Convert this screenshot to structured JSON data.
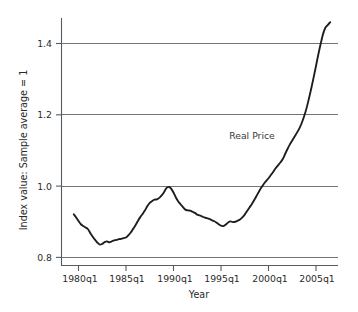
{
  "chart_data": {
    "type": "line",
    "title": "",
    "xlabel": "Year",
    "ylabel": "Index value: Sample average = 1",
    "grid": "horizontal gridlines at each y tick",
    "legend_position": "inline annotation on plot",
    "annotations": [
      {
        "text": "Real Price",
        "x": "2000q1",
        "y": 1.13
      }
    ],
    "xlim": [
      "1979q3",
      "2006q4"
    ],
    "ylim": [
      0.78,
      1.47
    ],
    "ytick_labels": [
      "0.8",
      "1.0",
      "1.2",
      "1.4"
    ],
    "ytick_values": [
      0.8,
      1.0,
      1.2,
      1.4
    ],
    "xtick_labels": [
      "1980q1",
      "1985q1",
      "1990q1",
      "1995q1",
      "2000q1",
      "2005q1"
    ],
    "xtick_values": [
      "1980q1",
      "1985q1",
      "1990q1",
      "1995q1",
      "2000q1",
      "2005q1"
    ],
    "series": [
      {
        "name": "Real Price",
        "color": "#1c1c1c",
        "x": [
          "1979q3",
          "1979q4",
          "1980q1",
          "1980q2",
          "1980q3",
          "1980q4",
          "1981q1",
          "1981q2",
          "1981q3",
          "1981q4",
          "1982q1",
          "1982q2",
          "1982q3",
          "1982q4",
          "1983q1",
          "1983q2",
          "1983q3",
          "1983q4",
          "1984q1",
          "1984q2",
          "1984q3",
          "1984q4",
          "1985q1",
          "1985q2",
          "1985q3",
          "1985q4",
          "1986q1",
          "1986q2",
          "1986q3",
          "1986q4",
          "1987q1",
          "1987q2",
          "1987q3",
          "1987q4",
          "1988q1",
          "1988q2",
          "1988q3",
          "1988q4",
          "1989q1",
          "1989q2",
          "1989q3",
          "1989q4",
          "1990q1",
          "1990q2",
          "1990q3",
          "1990q4",
          "1991q1",
          "1991q2",
          "1991q3",
          "1991q4",
          "1992q1",
          "1992q2",
          "1992q3",
          "1992q4",
          "1993q1",
          "1993q2",
          "1993q3",
          "1993q4",
          "1994q1",
          "1994q2",
          "1994q3",
          "1994q4",
          "1995q1",
          "1995q2",
          "1995q3",
          "1995q4",
          "1996q1",
          "1996q2",
          "1996q3",
          "1996q4",
          "1997q1",
          "1997q2",
          "1997q3",
          "1997q4",
          "1998q1",
          "1998q2",
          "1998q3",
          "1998q4",
          "1999q1",
          "1999q2",
          "1999q3",
          "1999q4",
          "2000q1",
          "2000q2",
          "2000q3",
          "2000q4",
          "2001q1",
          "2001q2",
          "2001q3",
          "2001q4",
          "2002q1",
          "2002q2",
          "2002q3",
          "2002q4",
          "2003q1",
          "2003q2",
          "2003q3",
          "2003q4",
          "2004q1",
          "2004q2",
          "2004q3",
          "2004q4",
          "2005q1",
          "2005q2",
          "2005q3",
          "2005q4",
          "2006q1",
          "2006q2",
          "2006q3"
        ],
        "y": [
          0.921,
          0.912,
          0.902,
          0.893,
          0.888,
          0.884,
          0.879,
          0.868,
          0.858,
          0.849,
          0.841,
          0.836,
          0.838,
          0.843,
          0.845,
          0.842,
          0.845,
          0.848,
          0.849,
          0.851,
          0.852,
          0.854,
          0.856,
          0.862,
          0.87,
          0.88,
          0.89,
          0.902,
          0.913,
          0.922,
          0.932,
          0.944,
          0.953,
          0.958,
          0.962,
          0.963,
          0.967,
          0.974,
          0.983,
          0.994,
          0.998,
          0.993,
          0.982,
          0.968,
          0.957,
          0.949,
          0.941,
          0.934,
          0.932,
          0.931,
          0.928,
          0.925,
          0.92,
          0.918,
          0.915,
          0.912,
          0.91,
          0.908,
          0.905,
          0.902,
          0.898,
          0.893,
          0.889,
          0.888,
          0.892,
          0.898,
          0.901,
          0.899,
          0.9,
          0.903,
          0.906,
          0.912,
          0.92,
          0.93,
          0.94,
          0.95,
          0.961,
          0.973,
          0.985,
          0.996,
          1.006,
          1.014,
          1.022,
          1.031,
          1.04,
          1.05,
          1.058,
          1.066,
          1.076,
          1.09,
          1.104,
          1.117,
          1.128,
          1.139,
          1.15,
          1.162,
          1.177,
          1.196,
          1.218,
          1.245,
          1.274,
          1.305,
          1.337,
          1.37,
          1.4,
          1.427,
          1.445,
          1.452,
          1.46
        ]
      }
    ]
  },
  "axes": {
    "y_tick_labels": [
      "1.4",
      "1.2",
      "1.0",
      "0.8"
    ],
    "x_tick_labels": [
      "1980q1",
      "1985q1",
      "1990q1",
      "1995q1",
      "2000q1",
      "2005q1"
    ],
    "y_axis_title": "Index value: Sample average = 1",
    "x_axis_title": "Year"
  },
  "series_label": "Real Price"
}
